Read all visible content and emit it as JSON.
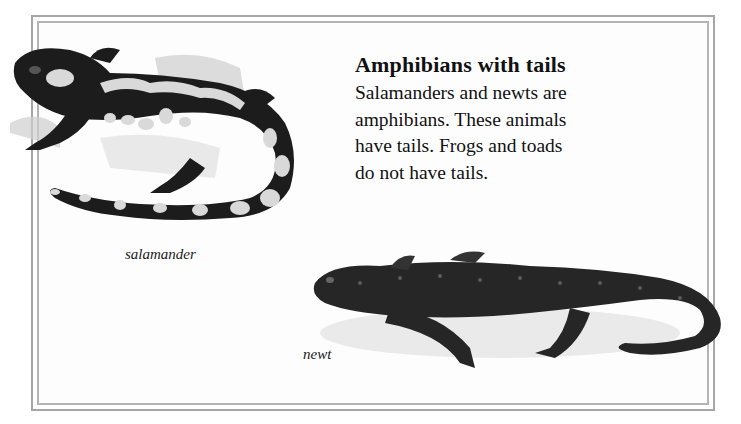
{
  "page": {
    "heading": "Amphibians with tails",
    "body_lines": [
      "Salamanders and newts are",
      "amphibians. These animals",
      "have tails. Frogs and toads",
      "do not have tails."
    ],
    "illustrations": [
      {
        "subject": "salamander",
        "caption": "salamander"
      },
      {
        "subject": "newt",
        "caption": "newt"
      }
    ]
  },
  "colors": {
    "frame": "#a6a6a6",
    "text": "#111111",
    "animal_dark": "#1c1c1c",
    "spots": "#d9d9d9"
  }
}
